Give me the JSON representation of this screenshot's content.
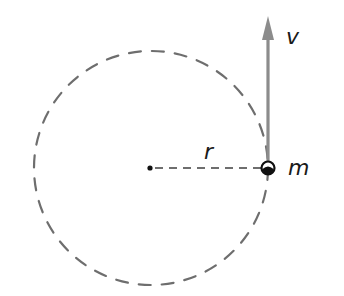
{
  "diagram": {
    "type": "circular-motion",
    "labels": {
      "velocity": "v",
      "radius": "r",
      "mass": "m"
    },
    "colors": {
      "orbit": "#6e6e6e",
      "arrow": "#8c8c8c",
      "text": "#1a1a1a",
      "center_dot": "#111111",
      "mass": "#111111"
    },
    "geometry": {
      "center": [
        151,
        168
      ],
      "radius": 117,
      "mass_position": [
        268,
        168
      ],
      "arrow_tip": [
        268,
        16
      ]
    }
  }
}
